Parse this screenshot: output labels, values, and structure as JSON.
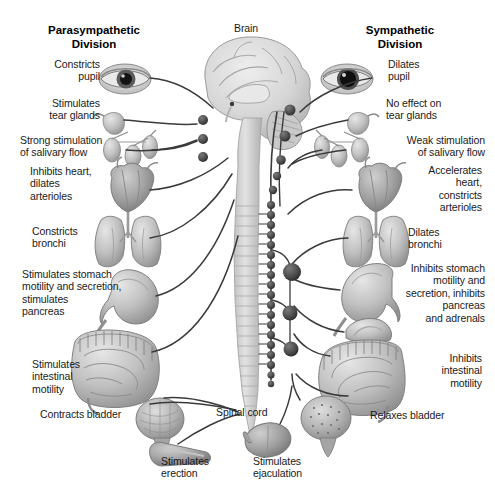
{
  "figure": {
    "kind": "anatomical-diagram"
  },
  "titles": {
    "left": "Parasympathetic\nDivision",
    "right": "Sympathetic\nDivision"
  },
  "central_labels": {
    "brain": "Brain",
    "spinal_cord": "Spinal cord"
  },
  "parasympathetic_labels": [
    "Constricts\npupil",
    "Stimulates\ntear glands",
    "Strong stimulation\nof salivary flow",
    "Inhibits heart,\ndilates\narterioles",
    "Constricts\nbronchi",
    "Stimulates stomach\nmotility and secretion,\nstimulates\npancreas",
    "Stimulates\nintestinal\nmotility",
    "Contracts bladder",
    "Stimulates\nerection"
  ],
  "sympathetic_labels": [
    "Dilates\npupil",
    "No effect on\ntear glands",
    "Weak stimulation\nof salivary flow",
    "Accelerates\nheart,\nconstricts\narterioles",
    "Dilates\nbronchi",
    "Inhibits stomach\nmotility and\nsecretion, inhibits\npancreas\nand adrenals",
    "Inhibits\nintestinal\nmotility",
    "Relaxes bladder",
    "Stimulates\nejaculation"
  ],
  "organs": {
    "left": [
      "eye",
      "tear-gland",
      "salivary-glands",
      "heart",
      "lungs",
      "stomach",
      "intestines",
      "bladder",
      "penis"
    ],
    "right": [
      "eye",
      "tear-gland",
      "salivary-glands",
      "heart",
      "lungs",
      "stomach",
      "adrenal-gland",
      "intestines",
      "bladder",
      "testis"
    ]
  },
  "colors": {
    "background": "#ffffff",
    "text": "#1a1a1a",
    "nerve": "#3a3a3a",
    "ganglion": "#4a4a4a",
    "organ_light": "#d8d8d8",
    "organ_mid": "#b4b4b4",
    "organ_dark": "#8e8e8e",
    "brain": "#d5d5d5",
    "cord": "#cfcfcf"
  }
}
